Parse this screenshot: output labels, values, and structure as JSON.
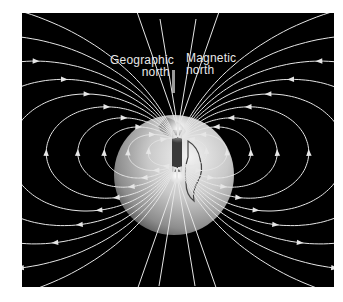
{
  "figure": {
    "background_color": "#000000",
    "line_color": "#e6e6e6",
    "labels": {
      "geographic_north": [
        "Geographic",
        "north"
      ],
      "magnetic_north": [
        "Magnetic",
        "north"
      ]
    },
    "globe": {
      "cx": 152,
      "cy": 162,
      "r": 60
    },
    "magnet": {
      "x": 150,
      "y": 117,
      "w": 10,
      "h": 42,
      "tilt_deg": 0,
      "color": "#3a3a3a"
    },
    "poles": {
      "top": {
        "x": 156,
        "y": 116
      },
      "bottom": {
        "x": 155,
        "y": 163
      }
    },
    "geographic_axis": {
      "x": 150,
      "y1": 57,
      "y2": 80
    },
    "field_line_scales": [
      30,
      48,
      70,
      95,
      125,
      160,
      200,
      250,
      320,
      420
    ]
  }
}
